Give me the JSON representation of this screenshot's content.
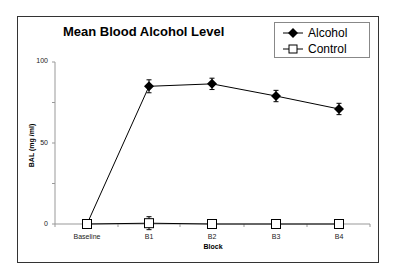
{
  "chart_data": {
    "type": "line",
    "title": "Mean Blood Alcohol Level",
    "xlabel": "Block",
    "ylabel": "BAL (mg /ml)",
    "categories": [
      "Baseline",
      "B1",
      "B2",
      "B3",
      "B4"
    ],
    "ylim": [
      0,
      100
    ],
    "yticks_major": [
      0,
      50,
      100
    ],
    "yticks_minor": [
      25,
      75
    ],
    "grid": false,
    "legend_position": "top-right",
    "series": [
      {
        "name": "Alcohol",
        "marker": "filled-diamond",
        "values": [
          0,
          85,
          86.5,
          79,
          71
        ],
        "errors": [
          0,
          4,
          3.5,
          3.5,
          3.5
        ]
      },
      {
        "name": "Control",
        "marker": "open-square",
        "values": [
          0,
          0.5,
          0,
          0,
          0
        ],
        "errors": [
          0,
          4,
          1.5,
          2,
          2.5
        ]
      }
    ]
  },
  "legend": {
    "items": [
      {
        "label": "Alcohol"
      },
      {
        "label": "Control"
      }
    ]
  },
  "axis": {
    "y_tick_labels": [
      "100",
      "50",
      "0"
    ],
    "x_tick_labels": [
      "Baseline",
      "B1",
      "B2",
      "B3",
      "B4"
    ]
  }
}
